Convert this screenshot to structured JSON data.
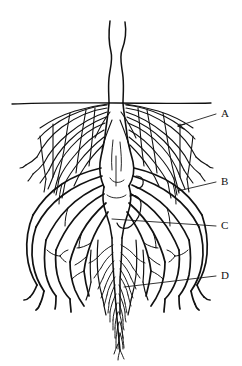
{
  "figure": {
    "kind": "botanical-line-drawing",
    "background_color": "#ffffff",
    "ink_color": "#111111",
    "soil_line": {
      "label": "",
      "y": 103,
      "x_start": 12,
      "x_end": 211
    }
  },
  "labels": [
    {
      "id": "A",
      "text": "A",
      "x": 222,
      "y": 110,
      "target_x": 178,
      "target_y": 126,
      "leader_from_x": 216,
      "leader_from_y": 114,
      "arrow": true,
      "refers_to": "upper fibrous feeder-root zone"
    },
    {
      "id": "B",
      "text": "B",
      "x": 222,
      "y": 178,
      "target_x": 178,
      "target_y": 191,
      "leader_from_x": 216,
      "leader_from_y": 182,
      "arrow": false,
      "refers_to": "lateral root"
    },
    {
      "id": "C",
      "text": "C",
      "x": 222,
      "y": 222,
      "target_x": 112,
      "target_y": 219,
      "leader_from_x": 216,
      "leader_from_y": 226,
      "arrow": false,
      "refers_to": "taproot crown / central root"
    },
    {
      "id": "D",
      "text": "D",
      "x": 222,
      "y": 272,
      "target_x": 124,
      "target_y": 287,
      "leader_from_x": 216,
      "leader_from_y": 276,
      "arrow": false,
      "refers_to": "deep taproot with fine branch roots"
    }
  ]
}
